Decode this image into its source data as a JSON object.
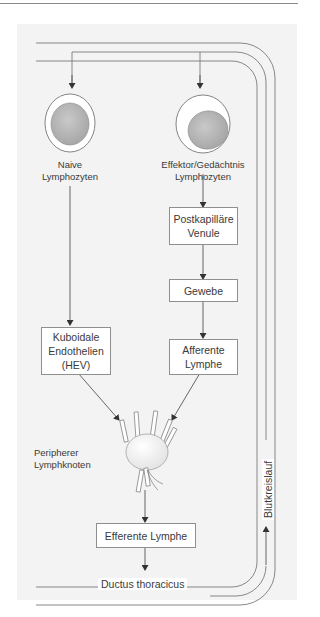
{
  "diagram": {
    "type": "lymphocyte recirculation flow",
    "colors": {
      "panel": "#f3f3f3",
      "box_border": "#8f8f8f",
      "line": "#777777",
      "nucleus": "#b5b5b5"
    },
    "cells": {
      "naive": {
        "label_line1": "Naive",
        "label_line2": "Lymphozyten"
      },
      "effector": {
        "label_line1": "Effektor/Gedächtnis",
        "label_line2": "Lymphozyten"
      }
    },
    "boxes": {
      "postkapillaere": "Postkapilläre\nVenule",
      "gewebe": "Gewebe",
      "kuboidale": "Kuboidale\nEndothelien\n(HEV)",
      "afferente": "Afferente\nLymphe",
      "efferente": "Efferente Lymphe"
    },
    "node": {
      "label_line1": "Peripherer",
      "label_line2": "Lymphknoten"
    },
    "vessels": {
      "blood": "Blutkreislauf",
      "duct": "Ductus thoracicus"
    },
    "edges": [
      [
        "Blutkreislauf",
        "Naive Lymphozyten"
      ],
      [
        "Blutkreislauf",
        "Effektor/Gedächtnis Lymphozyten"
      ],
      [
        "Naive Lymphozyten",
        "Kuboidale Endothelien (HEV)"
      ],
      [
        "Effektor/Gedächtnis Lymphozyten",
        "Postkapilläre Venule"
      ],
      [
        "Postkapilläre Venule",
        "Gewebe"
      ],
      [
        "Gewebe",
        "Afferente Lymphe"
      ],
      [
        "Kuboidale Endothelien (HEV)",
        "Peripherer Lymphknoten"
      ],
      [
        "Afferente Lymphe",
        "Peripherer Lymphknoten"
      ],
      [
        "Peripherer Lymphknoten",
        "Efferente Lymphe"
      ],
      [
        "Efferente Lymphe",
        "Ductus thoracicus"
      ],
      [
        "Ductus thoracicus",
        "Blutkreislauf"
      ]
    ]
  }
}
